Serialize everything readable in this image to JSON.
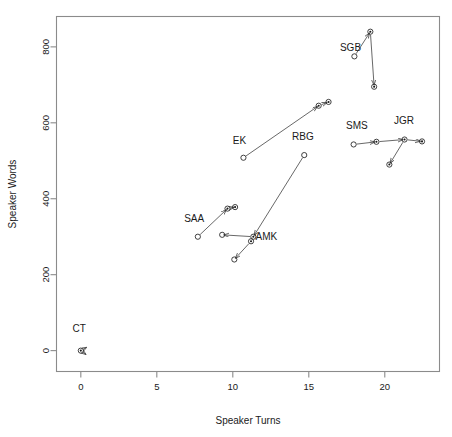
{
  "chart_data": {
    "type": "scatter",
    "title": "",
    "xlabel": "Speaker Turns",
    "ylabel": "Speaker Words",
    "xlim": [
      -1.6,
      23.6
    ],
    "ylim": [
      -55,
      880
    ],
    "xticks": [
      0,
      5,
      10,
      15,
      20
    ],
    "xtick_labels": [
      "0",
      "5",
      "10",
      "15",
      "20"
    ],
    "yticks": [
      0,
      200,
      400,
      600,
      800
    ],
    "ytick_labels": [
      "0",
      "200",
      "400",
      "600",
      "800"
    ],
    "grid": false,
    "legend": null,
    "annotations": [
      "SGB",
      "EK",
      "RBG",
      "SMS",
      "JGR",
      "SAA",
      "AMK",
      "CT"
    ],
    "series": [
      {
        "name": "SGB",
        "label": "SGB",
        "label_xy": [
          17.05,
          790
        ],
        "points": [
          {
            "x": 18.0,
            "y": 775,
            "marker": "circle"
          },
          {
            "x": 19.05,
            "y": 840,
            "marker": "circle-dot"
          },
          {
            "x": 19.3,
            "y": 695,
            "marker": "circle-dot"
          }
        ],
        "arrows": [
          {
            "from": [
              18.0,
              775
            ],
            "to": [
              19.05,
              840
            ]
          },
          {
            "from": [
              19.05,
              840
            ],
            "to": [
              19.3,
              695
            ]
          }
        ]
      },
      {
        "name": "EK",
        "label": "EK",
        "label_xy": [
          10.0,
          545
        ],
        "points": [
          {
            "x": 10.7,
            "y": 508,
            "marker": "circle"
          },
          {
            "x": 15.65,
            "y": 645,
            "marker": "circle-dot"
          },
          {
            "x": 16.3,
            "y": 655,
            "marker": "circle-dot"
          }
        ],
        "arrows": [
          {
            "from": [
              10.7,
              508
            ],
            "to": [
              15.65,
              645
            ]
          },
          {
            "from": [
              15.65,
              645
            ],
            "to": [
              16.3,
              655
            ]
          }
        ]
      },
      {
        "name": "RBG",
        "label": "RBG",
        "label_xy": [
          13.9,
          555
        ],
        "points": [
          {
            "x": 14.7,
            "y": 515,
            "marker": "circle"
          },
          {
            "x": 11.35,
            "y": 300,
            "marker": "circle-dot"
          }
        ],
        "arrows": [
          {
            "from": [
              14.7,
              515
            ],
            "to": [
              11.35,
              300
            ]
          }
        ]
      },
      {
        "name": "SMS",
        "label": "SMS",
        "label_xy": [
          17.45,
          583
        ],
        "points": [
          {
            "x": 17.95,
            "y": 543,
            "marker": "circle"
          },
          {
            "x": 19.45,
            "y": 550,
            "marker": "circle-dot"
          }
        ],
        "arrows": [
          {
            "from": [
              17.95,
              543
            ],
            "to": [
              19.45,
              550
            ]
          }
        ]
      },
      {
        "name": "JGR",
        "label": "JGR",
        "label_xy": [
          20.6,
          598
        ],
        "points": [
          {
            "x": 21.3,
            "y": 556,
            "marker": "circle-dot"
          },
          {
            "x": 22.45,
            "y": 551,
            "marker": "circle-dot"
          },
          {
            "x": 20.3,
            "y": 490,
            "marker": "circle-dot"
          }
        ],
        "arrows": [
          {
            "from": [
              19.45,
              550
            ],
            "to": [
              21.3,
              556
            ]
          },
          {
            "from": [
              21.3,
              556
            ],
            "to": [
              22.45,
              551
            ]
          },
          {
            "from": [
              21.3,
              556
            ],
            "to": [
              20.3,
              490
            ]
          }
        ]
      },
      {
        "name": "SAA",
        "label": "SAA",
        "label_xy": [
          6.8,
          338
        ],
        "points": [
          {
            "x": 7.7,
            "y": 300,
            "marker": "circle"
          },
          {
            "x": 9.65,
            "y": 374,
            "marker": "circle-dot"
          },
          {
            "x": 10.15,
            "y": 378,
            "marker": "circle-dot"
          }
        ],
        "arrows": [
          {
            "from": [
              7.7,
              300
            ],
            "to": [
              9.65,
              374
            ]
          },
          {
            "from": [
              9.65,
              374
            ],
            "to": [
              10.15,
              378
            ]
          }
        ]
      },
      {
        "name": "AMK",
        "label": "AMK",
        "label_xy": [
          11.5,
          292
        ],
        "points": [
          {
            "x": 11.2,
            "y": 288,
            "marker": "circle-dot"
          },
          {
            "x": 10.1,
            "y": 240,
            "marker": "circle"
          },
          {
            "x": 9.3,
            "y": 305,
            "marker": "circle"
          }
        ],
        "arrows": [
          {
            "from": [
              11.2,
              288
            ],
            "to": [
              10.1,
              240
            ]
          },
          {
            "from": [
              11.35,
              300
            ],
            "to": [
              9.3,
              305
            ]
          }
        ]
      },
      {
        "name": "CT",
        "label": "CT",
        "label_xy": [
          -0.55,
          48
        ],
        "points": [
          {
            "x": 0.0,
            "y": 0,
            "marker": "circle-dot"
          },
          {
            "x": 0.35,
            "y": 8,
            "marker": "none"
          },
          {
            "x": 0.3,
            "y": -14,
            "marker": "none"
          }
        ],
        "arrows": [
          {
            "from": [
              0.0,
              0
            ],
            "to": [
              0.45,
              10
            ]
          },
          {
            "from": [
              0.0,
              0
            ],
            "to": [
              0.4,
              -12
            ]
          }
        ]
      }
    ]
  }
}
